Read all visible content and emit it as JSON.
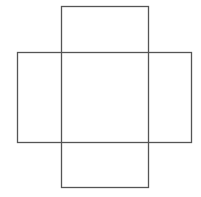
{
  "diagram": {
    "type": "cube-net-cross",
    "stroke_color": "#555555",
    "background": "#ffffff",
    "shapes": [
      {
        "name": "vertical-rectangle",
        "x": 61,
        "y": 6,
        "width": 87,
        "height": 181
      },
      {
        "name": "horizontal-rectangle",
        "x": 17,
        "y": 52,
        "width": 174,
        "height": 90
      }
    ]
  }
}
